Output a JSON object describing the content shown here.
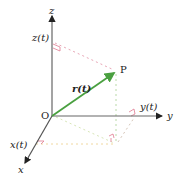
{
  "diagram": {
    "labels": {
      "origin": "O",
      "point": "P",
      "x_axis": "x",
      "y_axis": "y",
      "z_axis": "z",
      "x_component": "x(t)",
      "y_component": "y(t)",
      "z_component": "z(t)",
      "vector": "r(t)"
    },
    "colors": {
      "axis": "#555555",
      "vector": "#4aa040",
      "dashed_green": "#b9d9a8",
      "dashed_pink": "#e8a6b6",
      "right_angle": "#e07a90"
    }
  }
}
